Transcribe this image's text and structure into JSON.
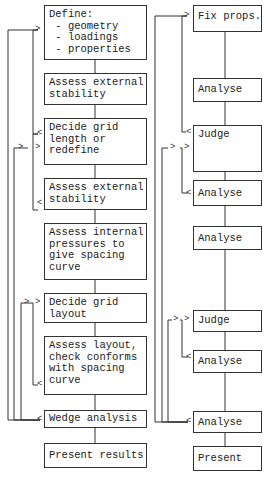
{
  "left_column": [
    {
      "id": "define",
      "text": "Define:\n - geometry\n - loadings\n - properties"
    },
    {
      "id": "assess-ext-1",
      "text": "Assess external\nstability"
    },
    {
      "id": "decide-grid-length",
      "text": "Decide grid\nlength or\nredefine"
    },
    {
      "id": "assess-ext-2",
      "text": "Assess external\nstability"
    },
    {
      "id": "assess-internal",
      "text": "Assess internal\npressures to\ngive spacing\ncurve"
    },
    {
      "id": "decide-grid-layout",
      "text": "Decide grid\nlayout"
    },
    {
      "id": "assess-layout",
      "text": "Assess layout,\ncheck conforms\nwith spacing\ncurve"
    },
    {
      "id": "wedge",
      "text": "Wedge analysis"
    },
    {
      "id": "present-results",
      "text": "Present results"
    }
  ],
  "right_column": [
    {
      "id": "fix-props",
      "text": "Fix props."
    },
    {
      "id": "analyse-1",
      "text": "Analyse"
    },
    {
      "id": "judge-1",
      "text": "Judge"
    },
    {
      "id": "analyse-2",
      "text": "Analyse"
    },
    {
      "id": "analyse-3",
      "text": "Analyse"
    },
    {
      "id": "judge-2",
      "text": "Judge"
    },
    {
      "id": "analyse-4",
      "text": "Analyse"
    },
    {
      "id": "analyse-5",
      "text": "Analyse"
    },
    {
      "id": "present",
      "text": "Present"
    }
  ],
  "markers": {
    "in": ">",
    "out": "<"
  }
}
